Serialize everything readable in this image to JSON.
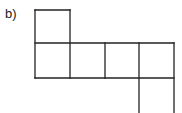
{
  "label": "b)",
  "diagram": {
    "type": "cube-net",
    "stroke_color": "#222222",
    "cell_size": 35,
    "lines": [
      {
        "x1": 35,
        "y1": 10,
        "x2": 70,
        "y2": 10
      },
      {
        "x1": 35,
        "y1": 10,
        "x2": 35,
        "y2": 78
      },
      {
        "x1": 70,
        "y1": 10,
        "x2": 70,
        "y2": 78
      },
      {
        "x1": 35,
        "y1": 43,
        "x2": 174,
        "y2": 43
      },
      {
        "x1": 35,
        "y1": 78,
        "x2": 174,
        "y2": 78
      },
      {
        "x1": 105,
        "y1": 43,
        "x2": 105,
        "y2": 78
      },
      {
        "x1": 139,
        "y1": 43,
        "x2": 139,
        "y2": 113
      },
      {
        "x1": 174,
        "y1": 43,
        "x2": 174,
        "y2": 113
      }
    ]
  }
}
